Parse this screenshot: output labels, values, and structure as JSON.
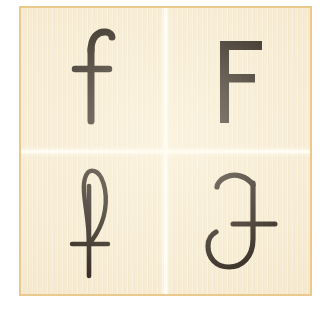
{
  "card": {
    "name": "letter-variants-card",
    "background_color": "#f6ead0",
    "border_color": "#e9c98c",
    "ink_color": "#241a12",
    "divider_color": "#fffdf6",
    "outer_background": "#ffffff",
    "grid_rows": 2,
    "grid_columns": 2
  },
  "cells": [
    {
      "position": "top-left",
      "letter": "f",
      "case": "lowercase",
      "style": "roman-serif",
      "description": "lowercase f with hooked top and crossbar"
    },
    {
      "position": "top-right",
      "letter": "F",
      "case": "uppercase",
      "style": "sans-serif",
      "description": "capital F with full top arm and shorter mid arm"
    },
    {
      "position": "bottom-left",
      "letter": "f",
      "case": "lowercase",
      "style": "script-cursive",
      "description": "script f with tall closed loop and crossbar"
    },
    {
      "position": "bottom-right",
      "letter": "F",
      "case": "uppercase",
      "style": "calligraphic-italic",
      "description": "calligraphic capital F with curved top arm, crossbar and left-curving bowl"
    }
  ]
}
